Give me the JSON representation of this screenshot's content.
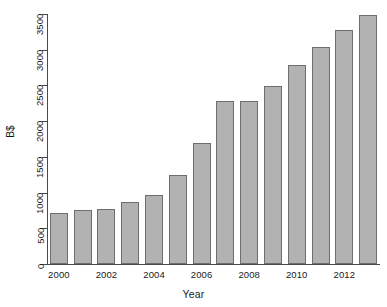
{
  "chart_data": {
    "type": "bar",
    "title": "",
    "xlabel": "Year",
    "ylabel": "B$",
    "categories": [
      "2000",
      "2001",
      "2002",
      "2003",
      "2004",
      "2005",
      "2006",
      "2007",
      "2008",
      "2009",
      "2010",
      "2011",
      "2012",
      "2013"
    ],
    "values": [
      720,
      750,
      770,
      870,
      960,
      1240,
      1700,
      2280,
      2280,
      2490,
      2780,
      3040,
      3280,
      3480
    ],
    "ylim": [
      0,
      3500
    ],
    "y_ticks": [
      0,
      500,
      1000,
      1500,
      2000,
      2500,
      3000,
      3500
    ],
    "y_tick_labels": [
      "0",
      "500",
      "1000",
      "1500",
      "2000",
      "2500",
      "3000",
      "3500"
    ],
    "x_tick_labels": [
      "2000",
      "2002",
      "2004",
      "2006",
      "2008",
      "2010",
      "2012"
    ],
    "x_tick_categories": [
      "2000",
      "2002",
      "2004",
      "2006",
      "2008",
      "2010",
      "2012"
    ],
    "grid": false,
    "legend": false,
    "bar_color": "#b2b2b2",
    "bar_border_color": "#6e6e6e",
    "axis_color": "#4a4a4a"
  }
}
